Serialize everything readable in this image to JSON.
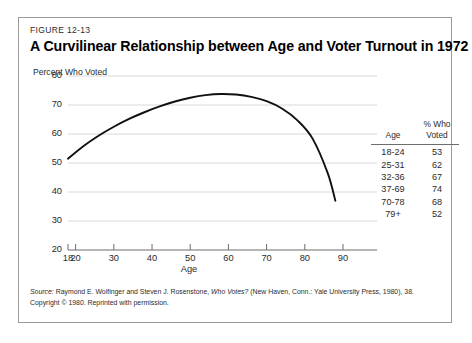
{
  "figure": {
    "number": "FIGURE 12-13",
    "title": "A Curvilinear Relationship between Age and Voter Turnout in 1972"
  },
  "source": {
    "label": "Source:",
    "text_before_title": " Raymond E. Wolfinger and Steven J. Rosenstone, ",
    "work_title": "Who Votes?",
    "text_after_title": " (New Haven, Conn.: Yale University Press, 1980), 38.",
    "copyright": "Copyright © 1980. Reprinted with permission."
  },
  "table": {
    "headers": {
      "age": "Age",
      "percent_line1": "% Who",
      "percent_line2": "Voted"
    },
    "rows": [
      {
        "age": "18-24",
        "percent": "53"
      },
      {
        "age": "25-31",
        "percent": "62"
      },
      {
        "age": "32-36",
        "percent": "67"
      },
      {
        "age": "37-69",
        "percent": "74"
      },
      {
        "age": "70-78",
        "percent": "68"
      },
      {
        "age": "79+",
        "percent": "52"
      }
    ]
  },
  "chart_data": {
    "type": "line",
    "title": "A Curvilinear Relationship between Age and Voter Turnout in 1972",
    "xlabel": "Age",
    "ylabel": "Percent Who Voted",
    "xlim": [
      18,
      90
    ],
    "ylim": [
      20,
      80
    ],
    "xticks": [
      18,
      20,
      30,
      40,
      50,
      60,
      70,
      80,
      90
    ],
    "yticks": [
      20,
      30,
      40,
      50,
      60,
      70,
      80
    ],
    "grid": "horizontal",
    "legend": "none",
    "line_color": "#101010",
    "grid_color": "#d8d8d8",
    "series": [
      {
        "name": "Percent who voted",
        "x": [
          18,
          22,
          26,
          30,
          34,
          38,
          42,
          46,
          50,
          54,
          58,
          62,
          66,
          70,
          74,
          78,
          82,
          86,
          88
        ],
        "y": [
          51.5,
          55.8,
          59.4,
          62.5,
          65.2,
          67.5,
          69.5,
          71.2,
          72.5,
          73.4,
          73.8,
          73.6,
          72.8,
          71.3,
          68.8,
          64.8,
          58.5,
          46.5,
          37.0
        ]
      }
    ]
  }
}
